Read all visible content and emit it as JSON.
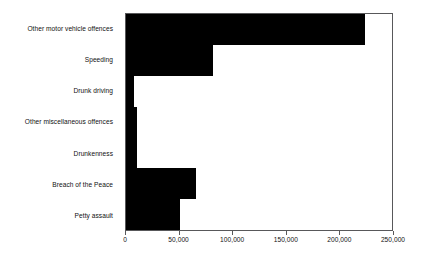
{
  "chart_data": {
    "type": "bar",
    "orientation": "horizontal",
    "title": "",
    "xlabel": "",
    "ylabel": "",
    "categories": [
      "Other motor vehicle offences",
      "Speeding",
      "Drunk driving",
      "Other miscellaneous offences",
      "Drunkenness",
      "Breach of the Peace",
      "Petty assault"
    ],
    "values": [
      225000,
      82000,
      7500,
      10000,
      10000,
      66000,
      51000
    ],
    "xlim": [
      0,
      250000
    ],
    "xticks": [
      0,
      50000,
      100000,
      150000,
      200000,
      250000
    ],
    "xtick_labels": [
      "0",
      "50,000",
      "100,000",
      "150,000",
      "200,000",
      "250,000"
    ],
    "grid": false,
    "legend": false,
    "bar_color": "#000000",
    "axis_color": "#58585a",
    "background": "#ffffff"
  }
}
